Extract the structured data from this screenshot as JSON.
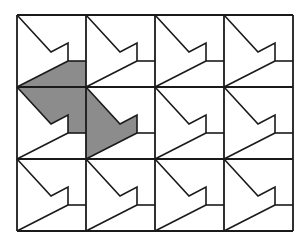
{
  "diagram": {
    "title": "",
    "grid": {
      "columns": 4,
      "rows": 3,
      "origin": [
        17,
        15
      ],
      "cell_width": 69,
      "cell_height": 72
    },
    "cell_motif": {
      "points_relative": {
        "top_left": [
          0,
          0
        ],
        "notch_inner": [
          34,
          37
        ],
        "notch_peak": [
          51,
          28
        ],
        "notch_bottom": [
          51,
          46
        ],
        "right_edge_join": [
          69,
          46
        ],
        "bottom_left": [
          0,
          72
        ]
      }
    },
    "shaded_tile": {
      "color": "#8c8c8c",
      "cells": [
        {
          "col": 0,
          "row": 0,
          "part": "lower-right"
        },
        {
          "col": 0,
          "row": 1,
          "part": "upper-right"
        },
        {
          "col": 1,
          "row": 1,
          "part": "left-arrow"
        }
      ]
    },
    "line_color": "#1a1a1a",
    "background": "#ffffff"
  }
}
